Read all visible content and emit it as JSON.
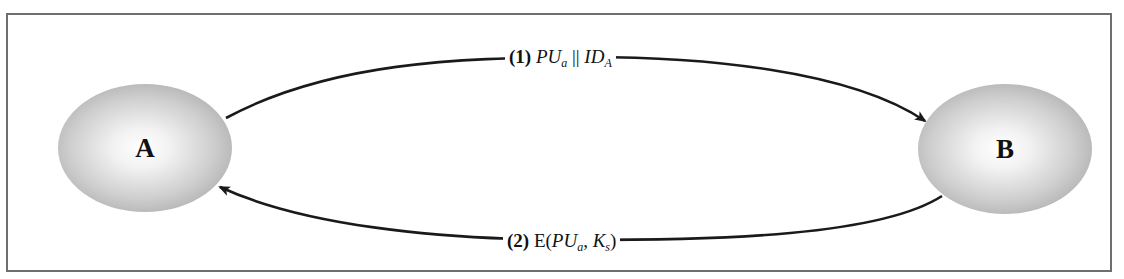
{
  "diagram": {
    "type": "protocol-exchange",
    "nodes": [
      {
        "id": "A",
        "label": "A"
      },
      {
        "id": "B",
        "label": "B"
      }
    ],
    "messages": [
      {
        "step": "(1)",
        "from": "A",
        "to": "B",
        "parts": {
          "pu": "PU",
          "pu_sub": "a",
          "concat": "||",
          "id": "ID",
          "id_sub": "A"
        },
        "text": "(1) PUa || IDA"
      },
      {
        "step": "(2)",
        "from": "B",
        "to": "A",
        "parts": {
          "func": "E(",
          "pu": "PU",
          "pu_sub": "a",
          "sep": ", ",
          "k": "K",
          "k_sub": "s",
          "close": ")"
        },
        "text": "(2) E(PUa, Ks)"
      }
    ],
    "colors": {
      "border": "#6e6e6e",
      "arrow": "#1a1a1a",
      "node_edge": "#9a9a9a",
      "node_center": "#ffffff"
    }
  }
}
